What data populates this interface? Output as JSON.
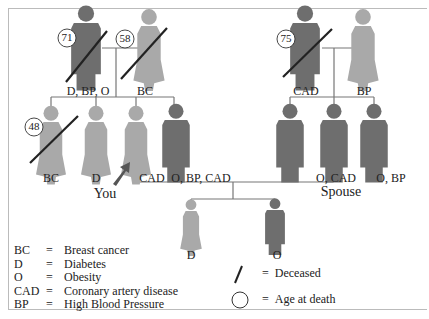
{
  "colors": {
    "male": "#6e6e6e",
    "female": "#a9a9a9",
    "line": "#777777",
    "slash": "#222222",
    "arrow": "#555555"
  },
  "grandparents_paternal": {
    "father": {
      "label": "D, BP, O",
      "age": "71",
      "deceased": true
    },
    "mother": {
      "label": "BC",
      "age": "58",
      "deceased": true
    }
  },
  "grandparents_maternal": {
    "father": {
      "label": "CAD",
      "age": "75",
      "deceased": true
    },
    "mother": {
      "label": "BP"
    }
  },
  "siblings": [
    {
      "label": "BC",
      "age": "48",
      "deceased": true,
      "sex": "F"
    },
    {
      "label": "D",
      "sex": "F"
    },
    {
      "label": "CAD",
      "sex": "F",
      "you": true
    },
    {
      "label": "O, BP, CAD",
      "sex": "M"
    }
  ],
  "spouse_siblings": [
    {
      "label": "",
      "sex": "M"
    },
    {
      "label": "O, CAD",
      "sex": "M",
      "spouse": true
    },
    {
      "label": "O, BP",
      "sex": "M"
    }
  ],
  "children": [
    {
      "label": "D",
      "sex": "F"
    },
    {
      "label": "O",
      "sex": "M"
    }
  ],
  "markers": {
    "you": "You",
    "spouse": "Spouse"
  },
  "legend": [
    {
      "abbr": "BC",
      "meaning": "Breast cancer"
    },
    {
      "abbr": "D",
      "meaning": "Diabetes"
    },
    {
      "abbr": "O",
      "meaning": "Obesity"
    },
    {
      "abbr": "CAD",
      "meaning": "Coronary artery disease"
    },
    {
      "abbr": "BP",
      "meaning": "High Blood Pressure"
    }
  ],
  "symbols": [
    {
      "symbol": "/",
      "meaning": "Deceased"
    },
    {
      "symbol": "circle",
      "meaning": "Age at death"
    }
  ],
  "eq": "="
}
